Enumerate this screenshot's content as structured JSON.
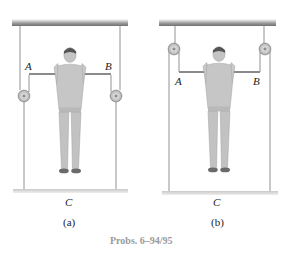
{
  "figure": {
    "panels": [
      {
        "id": "a",
        "sublabel": "(a)",
        "point_labels": {
          "A": "A",
          "B": "B",
          "C": "C"
        },
        "pulley_position": "below bar"
      },
      {
        "id": "b",
        "sublabel": "(b)",
        "point_labels": {
          "A": "A",
          "B": "B",
          "C": "C"
        },
        "pulley_position": "above bar"
      }
    ],
    "caption": "Probs. 6–94/95"
  },
  "colors": {
    "ceiling": "#8a8a8a",
    "rope": "#7a7a7a",
    "platform": "#b5b5b5",
    "person": "#bdbdbd",
    "caption": "#9a9a9a"
  }
}
